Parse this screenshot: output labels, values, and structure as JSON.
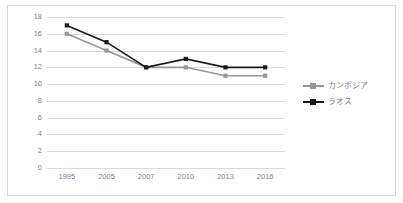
{
  "chart_data": {
    "type": "line",
    "title": "",
    "xlabel": "",
    "ylabel": "",
    "categories": [
      "1995",
      "2005",
      "2007",
      "2010",
      "2013",
      "2016"
    ],
    "series": [
      {
        "name": "カンボジア",
        "color": "#969696",
        "marker": "square",
        "values": [
          16,
          14,
          12,
          12,
          11,
          11
        ]
      },
      {
        "name": "ラオス",
        "color": "#1a1a1a",
        "marker": "square",
        "values": [
          17,
          15,
          12,
          13,
          12,
          12
        ]
      }
    ],
    "ylim": [
      0,
      18
    ],
    "ytick_step": 2,
    "yticks": [
      "0",
      "2",
      "4",
      "6",
      "8",
      "10",
      "12",
      "14",
      "16",
      "18"
    ],
    "grid": true,
    "grid_axis": "y",
    "legend_position": "right"
  },
  "style": {
    "grid_color": "#d9d9d9",
    "border_color": "#d9d9d9",
    "tick_label_color": "#7f7f7f",
    "legend_label_color": "#808080",
    "background": "#ffffff"
  }
}
